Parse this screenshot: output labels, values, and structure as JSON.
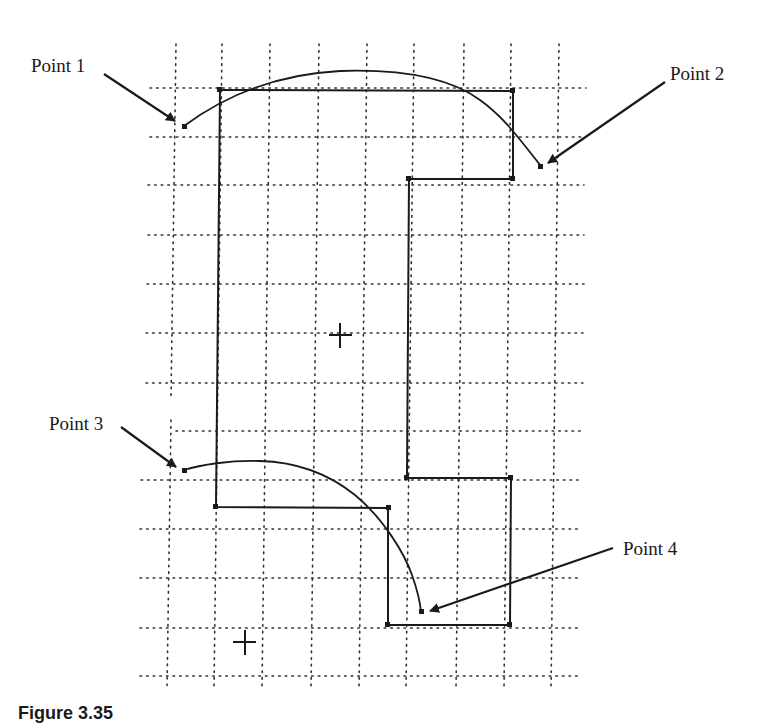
{
  "labels": {
    "point1": "Point 1",
    "point2": "Point 2",
    "point3": "Point 3",
    "point4": "Point 4"
  },
  "caption": "Figure 3.35",
  "colors": {
    "ink": "#1a1a1a",
    "grid": "#333333",
    "background": "#ffffff"
  },
  "grid": {
    "columns_x": [
      172,
      219,
      266,
      315,
      363,
      410,
      460,
      508,
      556
    ],
    "rows_y": [
      88,
      137,
      185,
      235,
      284,
      333,
      383,
      431,
      480,
      529,
      578,
      628,
      676
    ]
  },
  "shapes": {
    "upper_polygon": [
      [
        220,
        90
      ],
      [
        513,
        90
      ],
      [
        513,
        179
      ],
      [
        409,
        179
      ],
      [
        409,
        478
      ],
      [
        511,
        478
      ],
      [
        510,
        625
      ],
      [
        388,
        625
      ],
      [
        388,
        508
      ],
      [
        216,
        508
      ]
    ],
    "crosshairs": [
      [
        340,
        336
      ],
      [
        244,
        642
      ]
    ],
    "arc_top": {
      "start": [
        184,
        126
      ],
      "end": [
        541,
        166
      ]
    },
    "arc_bottom": {
      "start": [
        184,
        470
      ],
      "end": [
        421,
        612
      ]
    }
  }
}
